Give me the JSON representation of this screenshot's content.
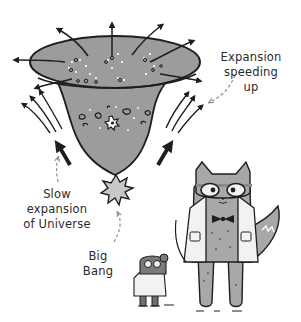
{
  "illustration": {
    "title": "Expansion of the Universe",
    "colors": {
      "background": "#ffffff",
      "funnel_fill": "#9c9c9c",
      "outline": "#1e1e1e",
      "cat_fill": "#a8a8a8",
      "coat_fill": "#f2f2f2",
      "label_text": "#2a2a2a",
      "dashed_pointer": "#8a8a8a"
    },
    "labels": {
      "expansion_speeding_up": {
        "lines": [
          "Expansion",
          "speeding",
          "up"
        ]
      },
      "slow_expansion": {
        "lines": [
          "Slow",
          "expansion",
          "of Universe"
        ]
      },
      "big_bang": {
        "lines": [
          "Big",
          "Bang"
        ]
      }
    },
    "characters": [
      {
        "name": "cat-scientist",
        "description": "Cat wearing goggles, bow tie and lab coat"
      },
      {
        "name": "mouse-scientist",
        "description": "Small mouse wearing goggles and lab coat"
      }
    ],
    "icons": [
      "outward-arrow-icon",
      "starburst-icon",
      "galaxy-spiral-icon",
      "star-icon"
    ]
  }
}
